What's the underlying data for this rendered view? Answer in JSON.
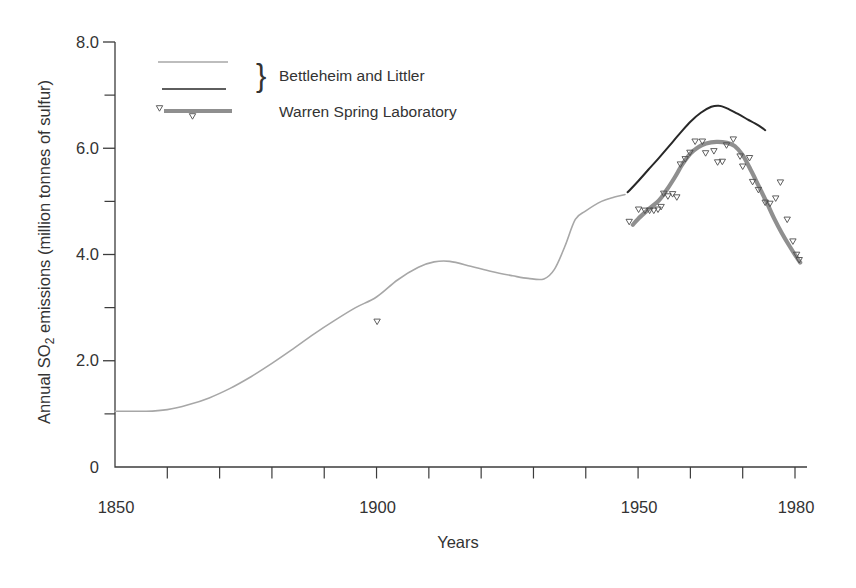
{
  "figure": {
    "xlabel": "Years",
    "ylabel_pre": "Annual SO",
    "ylabel_sub": "2",
    "ylabel_post": " emissions (million tonnes of sulfur)",
    "legend": {
      "brace_glyph": "}",
      "bettleheim_label": "Bettleheim and Littler",
      "warren_label": "Warren Spring Laboratory"
    },
    "colors": {
      "background": "#ffffff",
      "axis": "#3c3c3c",
      "text": "#333333",
      "historical_line": "#a7a7a7",
      "recent_line": "#282828",
      "warren_line": "#8f8f8f",
      "marker": "#4d4d4d"
    }
  },
  "chart_data": {
    "type": "line",
    "title": "",
    "xlabel": "Years",
    "ylabel": "Annual SO₂ emissions (million tonnes of sulfur)",
    "xlim": [
      1850,
      1982.5
    ],
    "ylim": [
      0,
      8
    ],
    "grid": false,
    "legend_position": "top-left-inside",
    "x_axis": {
      "major_ticks": [
        {
          "value": 1850,
          "label": "1850"
        },
        {
          "value": 1900,
          "label": "1900"
        },
        {
          "value": 1950,
          "label": "1950"
        },
        {
          "value": 1980,
          "label": "1980"
        }
      ],
      "minor_tick_values": [
        1860,
        1870,
        1880,
        1890,
        1900,
        1910,
        1920,
        1930,
        1940,
        1950,
        1960,
        1970,
        1980
      ]
    },
    "y_axis": {
      "major_ticks": [
        {
          "value": 0,
          "label": "0"
        },
        {
          "value": 2,
          "label": "2.0"
        },
        {
          "value": 4,
          "label": "4.0"
        },
        {
          "value": 6,
          "label": "6.0"
        },
        {
          "value": 8,
          "label": "8.0"
        }
      ],
      "minor_tick_values": [
        1,
        3,
        5,
        7
      ]
    },
    "series": [
      {
        "id": "historical",
        "name": "Bettleheim and Littler (historical curve)",
        "style": "line",
        "color": "#a7a7a7",
        "width": 1.6,
        "points": [
          [
            1850,
            1.05
          ],
          [
            1856,
            1.05
          ],
          [
            1860,
            1.08
          ],
          [
            1864,
            1.17
          ],
          [
            1868,
            1.3
          ],
          [
            1872,
            1.48
          ],
          [
            1876,
            1.7
          ],
          [
            1880,
            1.95
          ],
          [
            1884,
            2.22
          ],
          [
            1888,
            2.5
          ],
          [
            1892,
            2.76
          ],
          [
            1896,
            3.0
          ],
          [
            1900,
            3.2
          ],
          [
            1904,
            3.52
          ],
          [
            1908,
            3.76
          ],
          [
            1911,
            3.86
          ],
          [
            1914,
            3.87
          ],
          [
            1918,
            3.78
          ],
          [
            1922,
            3.68
          ],
          [
            1926,
            3.6
          ],
          [
            1929,
            3.55
          ],
          [
            1932,
            3.54
          ],
          [
            1934,
            3.72
          ],
          [
            1936,
            4.15
          ],
          [
            1938,
            4.66
          ],
          [
            1940,
            4.82
          ],
          [
            1943,
            5.0
          ],
          [
            1945.5,
            5.08
          ],
          [
            1947.5,
            5.13
          ]
        ]
      },
      {
        "id": "recent",
        "name": "Bettleheim and Littler (recent curve)",
        "style": "line",
        "color": "#282828",
        "width": 2,
        "points": [
          [
            1948,
            5.17
          ],
          [
            1950,
            5.38
          ],
          [
            1952,
            5.6
          ],
          [
            1954,
            5.82
          ],
          [
            1956,
            6.05
          ],
          [
            1958,
            6.28
          ],
          [
            1960,
            6.5
          ],
          [
            1962,
            6.67
          ],
          [
            1964,
            6.78
          ],
          [
            1965.5,
            6.8
          ],
          [
            1967,
            6.75
          ],
          [
            1969,
            6.65
          ],
          [
            1971,
            6.54
          ],
          [
            1973,
            6.43
          ],
          [
            1974.3,
            6.34
          ]
        ]
      },
      {
        "id": "warren_curve",
        "name": "Warren Spring Laboratory (smoothed curve)",
        "style": "line",
        "color": "#8f8f8f",
        "width": 4.2,
        "points": [
          [
            1949,
            4.56
          ],
          [
            1950,
            4.67
          ],
          [
            1952,
            4.85
          ],
          [
            1954,
            5.02
          ],
          [
            1955.5,
            5.22
          ],
          [
            1957,
            5.45
          ],
          [
            1958.5,
            5.7
          ],
          [
            1960,
            5.9
          ],
          [
            1961.5,
            6.02
          ],
          [
            1963,
            6.09
          ],
          [
            1965,
            6.12
          ],
          [
            1967,
            6.1
          ],
          [
            1968.5,
            6.04
          ],
          [
            1970,
            5.87
          ],
          [
            1971.5,
            5.6
          ],
          [
            1973,
            5.3
          ],
          [
            1974.5,
            5.0
          ],
          [
            1976,
            4.68
          ],
          [
            1977.5,
            4.4
          ],
          [
            1979,
            4.15
          ],
          [
            1980.3,
            3.95
          ],
          [
            1981,
            3.85
          ]
        ]
      },
      {
        "id": "warren_points",
        "name": "Warren Spring Laboratory (annual values)",
        "style": "scatter",
        "marker": "open-triangle-down",
        "color": "#4d4d4d",
        "points": [
          [
            1900.1,
            2.74
          ],
          [
            1948.3,
            4.62
          ],
          [
            1950.1,
            4.85
          ],
          [
            1951.3,
            4.83
          ],
          [
            1952.2,
            4.83
          ],
          [
            1953.0,
            4.83
          ],
          [
            1953.8,
            4.85
          ],
          [
            1954.4,
            4.9
          ],
          [
            1954.9,
            5.15
          ],
          [
            1955.7,
            5.1
          ],
          [
            1956.6,
            5.14
          ],
          [
            1957.4,
            5.08
          ],
          [
            1958.1,
            5.7
          ],
          [
            1959.0,
            5.8
          ],
          [
            1959.9,
            5.92
          ],
          [
            1960.9,
            6.13
          ],
          [
            1962.3,
            6.13
          ],
          [
            1962.9,
            5.91
          ],
          [
            1964.5,
            5.95
          ],
          [
            1965.2,
            5.74
          ],
          [
            1966.1,
            5.75
          ],
          [
            1966.9,
            6.06
          ],
          [
            1968.2,
            6.17
          ],
          [
            1969.5,
            5.85
          ],
          [
            1970.0,
            5.66
          ],
          [
            1971.3,
            5.82
          ],
          [
            1971.9,
            5.37
          ],
          [
            1973.0,
            5.22
          ],
          [
            1974.3,
            4.98
          ],
          [
            1975.2,
            4.96
          ],
          [
            1976.3,
            5.06
          ],
          [
            1977.2,
            5.36
          ],
          [
            1978.5,
            4.66
          ],
          [
            1979.6,
            4.25
          ],
          [
            1980.3,
            4.0
          ],
          [
            1980.8,
            3.9
          ]
        ]
      }
    ]
  }
}
